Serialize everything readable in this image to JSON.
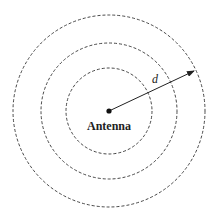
{
  "diagram": {
    "center_label": "Antenna",
    "distance_label": "d",
    "rings": [
      {
        "name": "inner-ring",
        "r": 43
      },
      {
        "name": "middle-ring",
        "r": 68
      },
      {
        "name": "outer-ring",
        "r": 96
      }
    ],
    "center": {
      "x": 109,
      "y": 111
    },
    "arrow_end": {
      "x": 194,
      "y": 71
    },
    "colors": {
      "stroke": "#333333",
      "background": "#ffffff"
    }
  }
}
